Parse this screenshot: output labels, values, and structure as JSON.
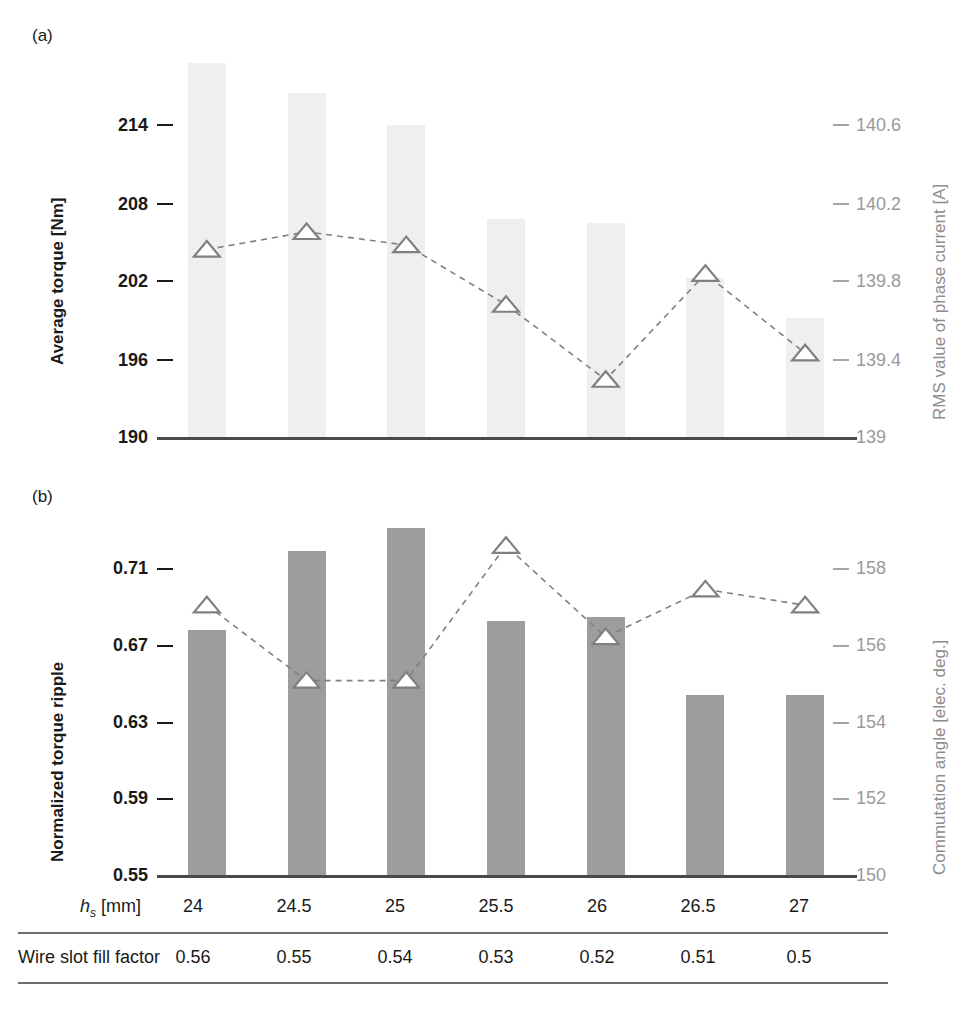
{
  "figure": {
    "panel_a_letter": "(a)",
    "panel_b_letter": "(b)"
  },
  "panel_a": {
    "left_axis_title": "Average torque [Nm]",
    "right_axis_title": "RMS value of phase current [A]",
    "left_ticks": [
      "214",
      "208",
      "202",
      "196",
      "190"
    ],
    "right_ticks": [
      "140.6",
      "140.2",
      "139.8",
      "139.4",
      "139"
    ]
  },
  "panel_b": {
    "left_axis_title": "Normalized torque ripple",
    "right_axis_title": "Commutation angle [elec. deg.]",
    "left_ticks": [
      "0.71",
      "0.67",
      "0.63",
      "0.59",
      "0.55"
    ],
    "right_ticks": [
      "158",
      "156",
      "154",
      "152",
      "150"
    ]
  },
  "table": {
    "row1_label_main": "h",
    "row1_label_sub": "s",
    "row1_label_unit": " [mm]",
    "row2_label": "Wire slot fill factor",
    "row1_values": [
      "24",
      "24.5",
      "25",
      "25.5",
      "26",
      "26.5",
      "27"
    ],
    "row2_values": [
      "0.56",
      "0.55",
      "0.54",
      "0.53",
      "0.52",
      "0.51",
      "0.5"
    ]
  },
  "colors": {
    "bar_light": "#efefef",
    "bar_dark": "#9d9d9d",
    "marker_stroke": "#808080",
    "marker_fill": "#ffffff",
    "axis": "#4a4a4a",
    "right_axis_text": "#9a9a9a",
    "left_axis_text": "#1a1a1a"
  },
  "chart_data": [
    {
      "type": "bar",
      "panel": "(a)",
      "title": "",
      "xlabel": "",
      "ylabel": "Average torque [Nm]",
      "y2label": "RMS value of phase current [A]",
      "categories": [
        "24",
        "24.5",
        "25",
        "25.5",
        "26",
        "26.5",
        "27"
      ],
      "ylim": [
        190,
        220
      ],
      "y2lim": [
        139,
        140.8
      ],
      "yticks": [
        214,
        208,
        202,
        196,
        190
      ],
      "y2ticks": [
        140.6,
        140.2,
        139.8,
        139.4,
        139
      ],
      "grid": false,
      "legend": "none",
      "series": [
        {
          "name": "Average torque",
          "render": "bar",
          "axis": "left",
          "color": "#efefef",
          "values": [
            218.3,
            216.0,
            213.6,
            206.5,
            206.2,
            202.0,
            199.0
          ]
        },
        {
          "name": "RMS value of phase current",
          "render": "line-marker",
          "marker": "triangle-up",
          "axis": "right",
          "linestyle": "dashed",
          "color": "#808080",
          "values": [
            139.85,
            139.93,
            139.87,
            139.6,
            139.26,
            139.74,
            139.38
          ]
        }
      ]
    },
    {
      "type": "bar",
      "panel": "(b)",
      "title": "",
      "xlabel": "",
      "ylabel": "Normalized torque ripple",
      "y2label": "Commutation angle [elec. deg.]",
      "categories": [
        "24",
        "24.5",
        "25",
        "25.5",
        "26",
        "26.5",
        "27"
      ],
      "ylim": [
        0.55,
        0.735
      ],
      "y2lim": [
        150,
        159.2
      ],
      "yticks": [
        0.71,
        0.67,
        0.63,
        0.59,
        0.55
      ],
      "y2ticks": [
        158,
        156,
        154,
        152,
        150
      ],
      "grid": false,
      "legend": "none",
      "series": [
        {
          "name": "Normalized torque ripple",
          "render": "bar",
          "axis": "left",
          "color": "#9d9d9d",
          "values": [
            0.674,
            0.714,
            0.726,
            0.679,
            0.681,
            0.641,
            0.641
          ]
        },
        {
          "name": "Commutation angle",
          "render": "line-marker",
          "marker": "triangle-up",
          "axis": "right",
          "linestyle": "dashed",
          "color": "#808080",
          "values": [
            156.8,
            154.9,
            154.9,
            158.3,
            156.0,
            157.2,
            156.8
          ]
        }
      ]
    }
  ]
}
